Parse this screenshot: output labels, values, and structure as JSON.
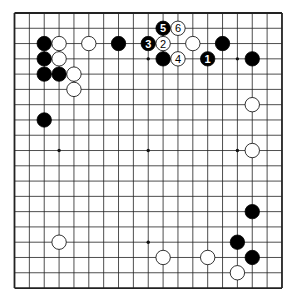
{
  "board": {
    "size": 19,
    "background": "#ffffff",
    "line_color": "#222222",
    "x0": 14.5,
    "dx": 14.86,
    "y0": 13,
    "dy": 15.28,
    "stone_radius": 7.2
  },
  "star_points": [
    [
      3,
      9
    ],
    [
      9,
      3
    ],
    [
      9,
      9
    ],
    [
      9,
      15
    ],
    [
      15,
      3
    ],
    [
      15,
      9
    ],
    [
      3,
      15
    ]
  ],
  "stones": [
    {
      "color": "black",
      "col": 2,
      "row": 2
    },
    {
      "color": "white",
      "col": 3,
      "row": 2
    },
    {
      "color": "white",
      "col": 5,
      "row": 2
    },
    {
      "color": "black",
      "col": 7,
      "row": 2
    },
    {
      "color": "black",
      "col": 2,
      "row": 3
    },
    {
      "color": "white",
      "col": 3,
      "row": 3
    },
    {
      "color": "black",
      "col": 2,
      "row": 4
    },
    {
      "color": "black",
      "col": 3,
      "row": 4
    },
    {
      "color": "white",
      "col": 4,
      "row": 4
    },
    {
      "color": "white",
      "col": 4,
      "row": 5
    },
    {
      "color": "black",
      "col": 2,
      "row": 7
    },
    {
      "color": "black",
      "col": 10,
      "row": 1,
      "label": "5"
    },
    {
      "color": "white",
      "col": 11,
      "row": 1,
      "label": "6"
    },
    {
      "color": "black",
      "col": 9,
      "row": 2,
      "label": "3"
    },
    {
      "color": "white",
      "col": 10,
      "row": 2,
      "label": "2"
    },
    {
      "color": "white",
      "col": 12,
      "row": 2
    },
    {
      "color": "black",
      "col": 14,
      "row": 2
    },
    {
      "color": "black",
      "col": 10,
      "row": 3
    },
    {
      "color": "white",
      "col": 11,
      "row": 3,
      "label": "4"
    },
    {
      "color": "black",
      "col": 13,
      "row": 3,
      "label": "1"
    },
    {
      "color": "black",
      "col": 16,
      "row": 3
    },
    {
      "color": "white",
      "col": 16,
      "row": 6
    },
    {
      "color": "white",
      "col": 16,
      "row": 9
    },
    {
      "color": "black",
      "col": 16,
      "row": 13
    },
    {
      "color": "black",
      "col": 15,
      "row": 15
    },
    {
      "color": "white",
      "col": 3,
      "row": 15
    },
    {
      "color": "white",
      "col": 10,
      "row": 16
    },
    {
      "color": "white",
      "col": 13,
      "row": 16
    },
    {
      "color": "black",
      "col": 16,
      "row": 16
    },
    {
      "color": "white",
      "col": 15,
      "row": 17
    }
  ]
}
